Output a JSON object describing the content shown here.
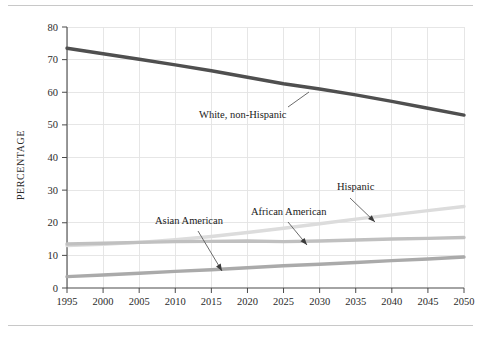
{
  "figure": {
    "background_color": "#ffffff",
    "has_top_rule": true,
    "has_bottom_rule": true,
    "rule_color": "#c8c8c8"
  },
  "chart_data": {
    "type": "line",
    "title": "",
    "xlabel": "",
    "ylabel": "PERCENTAGE",
    "x": [
      1995,
      2000,
      2005,
      2010,
      2015,
      2020,
      2025,
      2030,
      2035,
      2040,
      2045,
      2050
    ],
    "xlim": [
      1995,
      2050
    ],
    "ylim": [
      0,
      80
    ],
    "xticks": [
      1995,
      2000,
      2005,
      2010,
      2015,
      2020,
      2025,
      2030,
      2035,
      2040,
      2045,
      2050
    ],
    "yticks": [
      0,
      10,
      20,
      30,
      40,
      50,
      60,
      70,
      80
    ],
    "xtick_labels": [
      "1995",
      "2000",
      "2005",
      "2010",
      "2015",
      "2020",
      "2025",
      "2030",
      "2035",
      "2040",
      "2045",
      "2050"
    ],
    "ytick_labels": [
      "0",
      "10",
      "20",
      "30",
      "40",
      "50",
      "60",
      "70",
      "80"
    ],
    "grid": true,
    "grid_color": "#e3e3e3",
    "legend": "inline-annotations",
    "series": [
      {
        "name": "White, non-Hispanic",
        "color": "#4f4f4f",
        "width": 3.4,
        "values": [
          73.5,
          71.8,
          70.1,
          68.4,
          66.6,
          64.6,
          62.6,
          61.0,
          59.2,
          57.2,
          55.1,
          53.0
        ]
      },
      {
        "name": "Hispanic",
        "color": "#dcdcdc",
        "width": 3.4,
        "values": [
          13.0,
          13.4,
          14.0,
          14.8,
          15.8,
          17.0,
          18.3,
          19.7,
          21.1,
          22.4,
          23.7,
          25.0
        ]
      },
      {
        "name": "African American",
        "color": "#c0c0c0",
        "width": 3.4,
        "values": [
          13.5,
          13.7,
          14.0,
          14.2,
          14.3,
          14.4,
          14.2,
          14.4,
          14.7,
          15.0,
          15.2,
          15.5
        ]
      },
      {
        "name": "Asian American",
        "color": "#aaaaaa",
        "width": 3.4,
        "values": [
          3.5,
          4.0,
          4.5,
          5.1,
          5.6,
          6.2,
          6.8,
          7.3,
          7.8,
          8.4,
          8.9,
          9.5
        ]
      }
    ],
    "annotations": [
      {
        "text": "White, non-Hispanic",
        "series": "White, non-Hispanic"
      },
      {
        "text": "Asian American",
        "series": "Asian American"
      },
      {
        "text": "African American",
        "series": "African American"
      },
      {
        "text": "Hispanic",
        "series": "Hispanic"
      }
    ]
  }
}
